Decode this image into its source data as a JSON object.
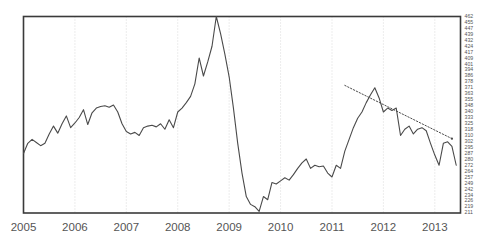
{
  "chart_data": {
    "type": "line",
    "title": "",
    "subtitle": "",
    "xlabel": "",
    "ylabel": "",
    "grid": "vertical-dotted-at-years",
    "legend": "none",
    "xlim": [
      "2005-01",
      "2013-07"
    ],
    "ylim": [
      211,
      462
    ],
    "x_tick_labels": [
      "2005",
      "2006",
      "2007",
      "2008",
      "2009",
      "2010",
      "2011",
      "2012",
      "2013"
    ],
    "y_tick_labels": [
      "462",
      "455",
      "447",
      "439",
      "432",
      "424",
      "417",
      "409",
      "401",
      "394",
      "386",
      "378",
      "371",
      "363",
      "355",
      "348",
      "340",
      "333",
      "325",
      "318",
      "310",
      "302",
      "295",
      "287",
      "280",
      "272",
      "264",
      "257",
      "249",
      "242",
      "234",
      "226",
      "219",
      "211"
    ],
    "y_axis_position": "right",
    "series": [
      {
        "name": "index",
        "style": "solid",
        "x": [
          "2005-01",
          "2005-02",
          "2005-03",
          "2005-04",
          "2005-05",
          "2005-06",
          "2005-07",
          "2005-08",
          "2005-09",
          "2005-10",
          "2005-11",
          "2005-12",
          "2006-01",
          "2006-02",
          "2006-03",
          "2006-04",
          "2006-05",
          "2006-06",
          "2006-07",
          "2006-08",
          "2006-09",
          "2006-10",
          "2006-11",
          "2006-12",
          "2007-01",
          "2007-02",
          "2007-03",
          "2007-04",
          "2007-05",
          "2007-06",
          "2007-07",
          "2007-08",
          "2007-09",
          "2007-10",
          "2007-11",
          "2007-12",
          "2008-01",
          "2008-02",
          "2008-03",
          "2008-04",
          "2008-05",
          "2008-06",
          "2008-07",
          "2008-08",
          "2008-09",
          "2008-10",
          "2008-11",
          "2008-12",
          "2009-01",
          "2009-02",
          "2009-03",
          "2009-04",
          "2009-05",
          "2009-06",
          "2009-07",
          "2009-08",
          "2009-09",
          "2009-10",
          "2009-11",
          "2009-12",
          "2010-01",
          "2010-02",
          "2010-03",
          "2010-04",
          "2010-05",
          "2010-06",
          "2010-07",
          "2010-08",
          "2010-09",
          "2010-10",
          "2010-11",
          "2010-12",
          "2011-01",
          "2011-02",
          "2011-03",
          "2011-04",
          "2011-05",
          "2011-06",
          "2011-07",
          "2011-08",
          "2011-09",
          "2011-10",
          "2011-11",
          "2011-12",
          "2012-01",
          "2012-02",
          "2012-03",
          "2012-04",
          "2012-05",
          "2012-06",
          "2012-07",
          "2012-08",
          "2012-09",
          "2012-10",
          "2012-11",
          "2012-12",
          "2013-01",
          "2013-02",
          "2013-03",
          "2013-04",
          "2013-05",
          "2013-06"
        ],
        "values": [
          287,
          300,
          305,
          301,
          297,
          300,
          312,
          322,
          313,
          325,
          335,
          320,
          326,
          333,
          343,
          324,
          339,
          345,
          347,
          348,
          346,
          349,
          340,
          325,
          315,
          312,
          314,
          310,
          320,
          322,
          323,
          321,
          325,
          318,
          330,
          320,
          340,
          345,
          352,
          360,
          376,
          409,
          386,
          404,
          424,
          462,
          440,
          414,
          385,
          345,
          300,
          262,
          232,
          222,
          219,
          213,
          232,
          228,
          250,
          248,
          252,
          256,
          253,
          260,
          268,
          275,
          280,
          268,
          272,
          270,
          271,
          262,
          257,
          272,
          268,
          290,
          305,
          320,
          332,
          340,
          352,
          362,
          371,
          358,
          340,
          345,
          342,
          345,
          310,
          318,
          322,
          312,
          318,
          320,
          316,
          300,
          285,
          272,
          300,
          302,
          296,
          272
        ]
      }
    ],
    "annotations": [
      {
        "type": "trendline",
        "style": "dotted",
        "name": "downtrend-line",
        "from": {
          "x": "2011-04",
          "y": 374
        },
        "to": {
          "x": "2013-05",
          "y": 306
        },
        "endpoint_marker": true
      }
    ]
  }
}
